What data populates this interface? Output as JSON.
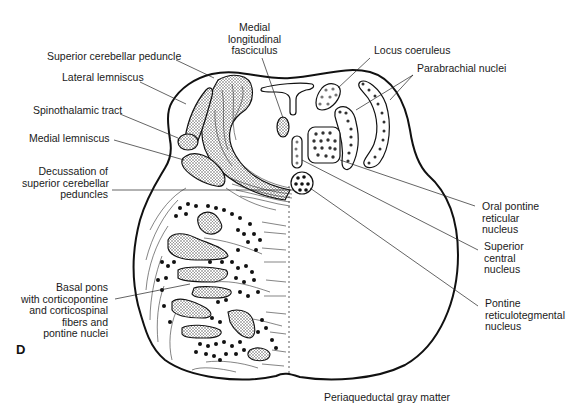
{
  "figure": {
    "panel_letter": "D",
    "caption": "Periaqueductal gray matter",
    "colors": {
      "ink": "#111111",
      "stipple": "#bdbdbd",
      "background": "#ffffff"
    }
  },
  "labels": {
    "mlf": {
      "lines": [
        "Medial",
        "longitudinal",
        "fasciculus"
      ]
    },
    "scp": {
      "lines": [
        "Superior cerebellar peduncle"
      ]
    },
    "lateral_lemniscus": {
      "lines": [
        "Lateral lemniscus"
      ]
    },
    "spinothalamic": {
      "lines": [
        "Spinothalamic tract"
      ]
    },
    "medial_lemniscus": {
      "lines": [
        "Medial lemniscus"
      ]
    },
    "decussation": {
      "lines": [
        "Decussation of",
        "superior cerebellar",
        "peduncles"
      ]
    },
    "basal_pons": {
      "lines": [
        "Basal pons",
        "with corticopontine",
        "and corticospinal",
        "fibers and",
        "pontine nuclei"
      ]
    },
    "locus_coeruleus": {
      "lines": [
        "Locus coeruleus"
      ]
    },
    "parabrachial": {
      "lines": [
        "Parabrachial nuclei"
      ]
    },
    "oral_pontine": {
      "lines": [
        "Oral pontine",
        "reticular",
        "nucleus"
      ]
    },
    "superior_central": {
      "lines": [
        "Superior",
        "central",
        "nucleus"
      ]
    },
    "pontine_reticulotegmental": {
      "lines": [
        "Pontine",
        "reticulotegmental",
        "nucleus"
      ]
    }
  }
}
